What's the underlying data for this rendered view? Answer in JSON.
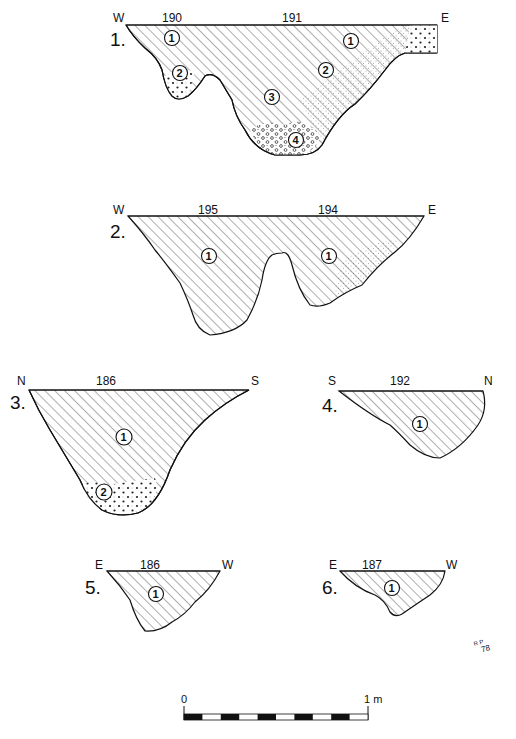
{
  "figure": {
    "sections": [
      {
        "number": "1.",
        "left_dir": "W",
        "right_dir": "E",
        "feature_labels": [
          "190",
          "191"
        ],
        "layers": [
          "1",
          "2",
          "1",
          "2",
          "3",
          "4"
        ]
      },
      {
        "number": "2.",
        "left_dir": "W",
        "right_dir": "E",
        "feature_labels": [
          "195",
          "194"
        ],
        "layers": [
          "1",
          "1"
        ]
      },
      {
        "number": "3.",
        "left_dir": "N",
        "right_dir": "S",
        "feature_labels": [
          "186"
        ],
        "layers": [
          "1",
          "2"
        ]
      },
      {
        "number": "4.",
        "left_dir": "S",
        "right_dir": "N",
        "feature_labels": [
          "192"
        ],
        "layers": [
          "1"
        ]
      },
      {
        "number": "5.",
        "left_dir": "E",
        "right_dir": "W",
        "feature_labels": [
          "186"
        ],
        "layers": [
          "1"
        ]
      },
      {
        "number": "6.",
        "left_dir": "E",
        "right_dir": "W",
        "feature_labels": [
          "187"
        ],
        "layers": [
          "1"
        ]
      }
    ],
    "signature": {
      "initials": "R P",
      "year": "78"
    },
    "scale_bar": {
      "start_label": "0",
      "end_label": "1 m",
      "segments": 10
    }
  }
}
